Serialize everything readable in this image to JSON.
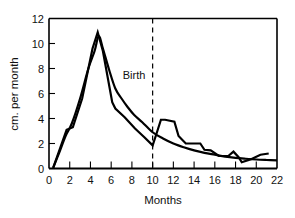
{
  "chart_data": {
    "type": "line",
    "title": "",
    "xlabel": "Months",
    "ylabel": "cm. per month",
    "xlim": [
      0,
      22
    ],
    "ylim": [
      0,
      12
    ],
    "grid": false,
    "legend": "none",
    "xticks": [
      "0",
      "2",
      "4",
      "6",
      "8",
      "10",
      "12",
      "14",
      "16",
      "18",
      "20",
      "22"
    ],
    "xtick_values": [
      0,
      2,
      4,
      6,
      8,
      10,
      12,
      14,
      16,
      18,
      20,
      22
    ],
    "yticks": [
      "0",
      "2",
      "4",
      "6",
      "8",
      "10",
      "12"
    ],
    "ytick_values": [
      0,
      2,
      4,
      6,
      8,
      10,
      12
    ],
    "annotations": [
      {
        "name": "birth-marker",
        "label": "Birth",
        "x": 10,
        "style": "dashed-vertical-line",
        "label_x": 9.3,
        "label_y": 7.2
      }
    ],
    "series": [
      {
        "name": "smooth-curve",
        "style": "smooth",
        "color": "#000000",
        "linewidth": 2.2,
        "x": [
          0.4,
          1.0,
          1.6,
          2.2,
          3.0,
          3.8,
          4.4,
          4.8,
          5.2,
          5.8,
          6.4,
          7.0,
          7.6,
          8.2,
          9.0,
          10.0,
          11.0,
          12.0,
          13.0,
          14.0,
          15.0,
          16.0,
          17.0,
          18.0,
          19.0,
          20.0,
          21.0,
          22.0
        ],
        "y": [
          0.05,
          1.3,
          2.6,
          3.6,
          5.6,
          8.0,
          9.4,
          10.6,
          9.6,
          7.9,
          6.4,
          5.6,
          4.9,
          4.3,
          3.7,
          2.9,
          2.4,
          2.0,
          1.7,
          1.45,
          1.25,
          1.1,
          0.95,
          0.85,
          0.78,
          0.72,
          0.68,
          0.65
        ]
      },
      {
        "name": "angular-curve",
        "style": "piecewise-linear",
        "color": "#000000",
        "linewidth": 2.2,
        "x": [
          0.4,
          1.7,
          2.3,
          3.2,
          4.2,
          4.7,
          5.2,
          6.1,
          6.4,
          7.3,
          8.3,
          9.2,
          10.0,
          10.3,
          10.8,
          11.2,
          12.1,
          12.5,
          13.2,
          14.6,
          15.0,
          15.6,
          16.4,
          17.3,
          17.8,
          18.3,
          18.6,
          19.5,
          20.4,
          21.2
        ],
        "y": [
          0.05,
          3.1,
          3.3,
          5.6,
          9.6,
          10.9,
          9.4,
          5.3,
          4.8,
          4.1,
          3.2,
          2.5,
          1.85,
          2.6,
          3.9,
          3.9,
          3.75,
          2.6,
          2.0,
          2.0,
          1.5,
          1.45,
          1.0,
          1.0,
          1.35,
          0.9,
          0.5,
          0.75,
          1.1,
          1.2
        ]
      }
    ]
  }
}
